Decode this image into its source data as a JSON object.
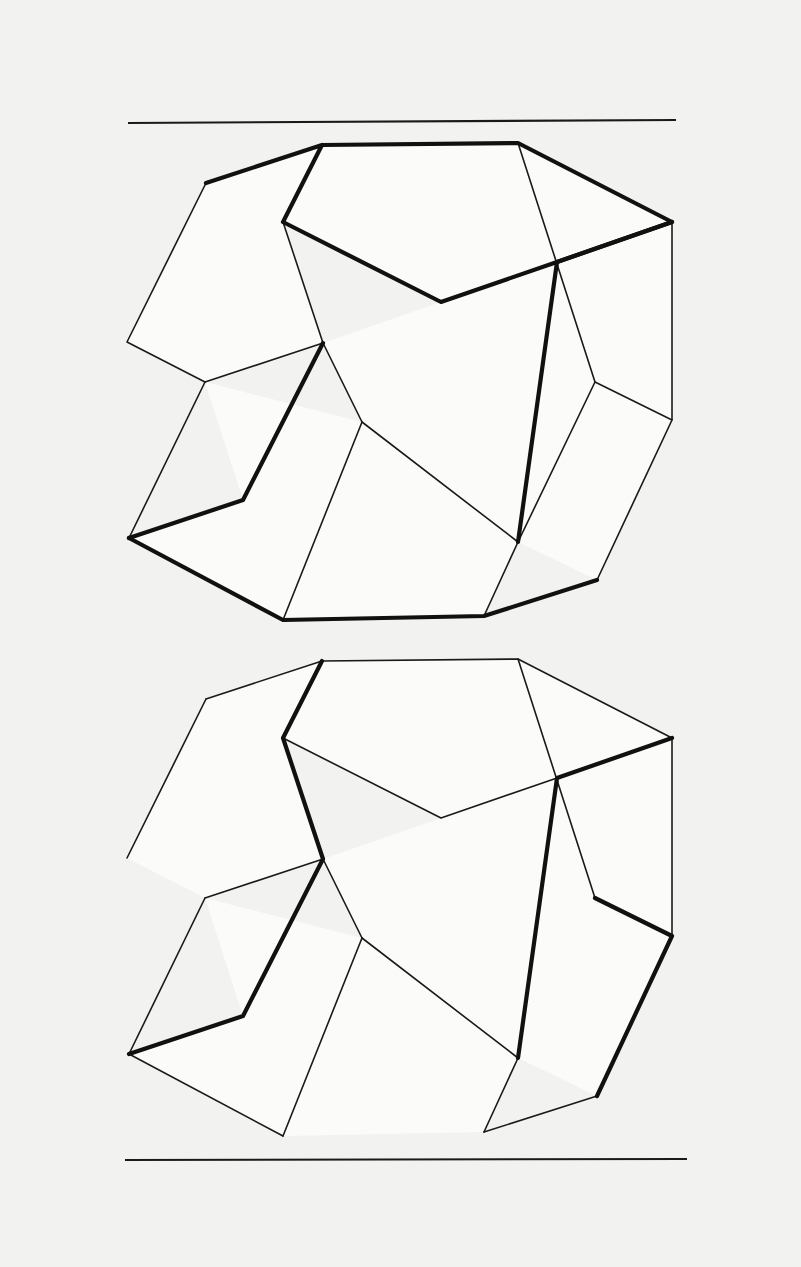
{
  "page": {
    "background_color": "#f2f2f0",
    "ink_color": "#1a1a1a",
    "width": 801,
    "height": 1267
  },
  "rules": {
    "top": {
      "name": "top-rule",
      "x1": 128,
      "y1": 123,
      "x2": 676,
      "y2": 120
    },
    "bottom": {
      "name": "bottom-rule",
      "x1": 125,
      "y1": 1160,
      "x2": 687,
      "y2": 1159
    }
  },
  "figures": [
    {
      "id": "upper-figure",
      "label": "Upper ambiguous block",
      "offset_y": 0,
      "bold_edges": "top-shelf"
    },
    {
      "id": "lower-figure",
      "label": "Lower ambiguous block",
      "offset_y": 516,
      "bold_edges": "bottom-shelf"
    }
  ],
  "geometry": {
    "note": "Isometric parallelogram lattice; coordinates in page pixels for the upper figure.",
    "vertices": {
      "tl_peak": [
        322,
        145
      ],
      "tl_corner": [
        206,
        183
      ],
      "tl_inner": [
        283,
        222
      ],
      "tr_peak": [
        518,
        143
      ],
      "tr_corner": [
        672,
        222
      ],
      "tr_inner": [
        557,
        262
      ],
      "ml_left": [
        127,
        342
      ],
      "ml_joint": [
        205,
        382
      ],
      "mid_upper": [
        323,
        343
      ],
      "mid_center": [
        441,
        302
      ],
      "mid_lower_l": [
        362,
        422
      ],
      "mid_right": [
        595,
        382
      ],
      "bl_corner": [
        129,
        538
      ],
      "bl_notch": [
        243,
        500
      ],
      "bl_inner": [
        283,
        620
      ],
      "br_joint": [
        518,
        542
      ],
      "br_right": [
        672,
        420
      ],
      "br_corner": [
        597,
        580
      ],
      "br_bottom": [
        484,
        616
      ]
    }
  }
}
